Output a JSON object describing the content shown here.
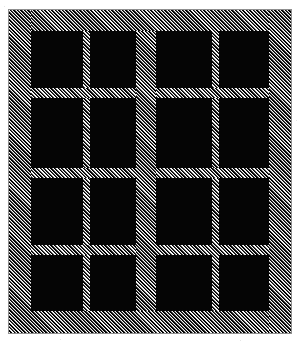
{
  "drawing": {
    "title": "Window with hatched frame",
    "subject": "window",
    "style": "line drawing with diagonal hatching",
    "background_color": "#ffffff",
    "frame_hatch_color": "#000000",
    "frame_fill_color": "#e9e9e9",
    "pane_color": "#050505",
    "outline_color": "#8f8f8f"
  },
  "frame": {
    "label": "outer-frame",
    "members": [
      {
        "name": "frame-top",
        "label": "top rail"
      },
      {
        "name": "frame-bottom",
        "label": "bottom rail"
      },
      {
        "name": "frame-left",
        "label": "left stile"
      },
      {
        "name": "frame-right",
        "label": "right stile"
      }
    ]
  },
  "mullion": {
    "label": "center mullion"
  },
  "sashes": [
    {
      "name": "left-sash",
      "label": "left sash",
      "columns": 2,
      "rows": 4,
      "panes": [
        {
          "label": "pane-r1c1"
        },
        {
          "label": "pane-r1c2"
        },
        {
          "label": "pane-r2c1"
        },
        {
          "label": "pane-r2c2"
        },
        {
          "label": "pane-r3c1"
        },
        {
          "label": "pane-r3c2"
        },
        {
          "label": "pane-r4c1"
        },
        {
          "label": "pane-r4c2"
        }
      ]
    },
    {
      "name": "right-sash",
      "label": "right sash",
      "columns": 2,
      "rows": 4,
      "panes": [
        {
          "label": "pane-r1c1"
        },
        {
          "label": "pane-r1c2"
        },
        {
          "label": "pane-r2c1"
        },
        {
          "label": "pane-r2c2"
        },
        {
          "label": "pane-r3c1"
        },
        {
          "label": "pane-r3c2"
        },
        {
          "label": "pane-r4c1"
        },
        {
          "label": "pane-r4c2"
        }
      ]
    }
  ],
  "muntins": {
    "vertical_label": "vertical muntin",
    "horizontal_label": "horizontal muntin"
  },
  "totals": {
    "pane_count": "16",
    "sash_count": "2"
  }
}
